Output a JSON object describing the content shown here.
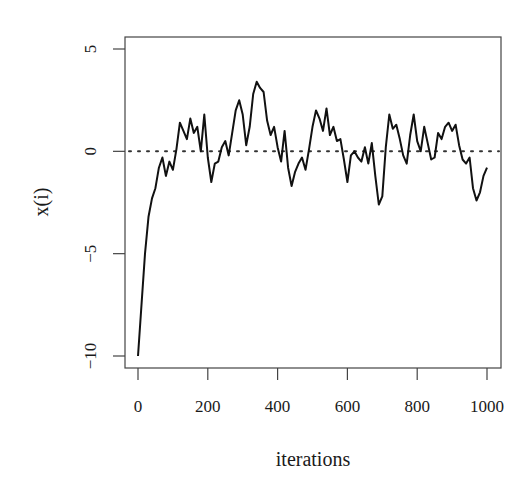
{
  "chart_data": {
    "type": "line",
    "title": "",
    "xlabel": "iterations",
    "ylabel": "x(i)",
    "xlim": [
      0,
      1000
    ],
    "ylim": [
      -10,
      5
    ],
    "x_ticks": [
      0,
      200,
      400,
      600,
      800,
      1000
    ],
    "x_tick_labels": [
      "0",
      "200",
      "400",
      "600",
      "800",
      "1000"
    ],
    "y_ticks": [
      -10,
      -5,
      0,
      5
    ],
    "y_tick_labels": [
      "−10",
      "−5",
      "0",
      "5"
    ],
    "grid": false,
    "legend": null,
    "reference_line": {
      "y": 0,
      "style": "dotted"
    },
    "series": [
      {
        "name": "x(i)",
        "x": [
          0,
          10,
          20,
          30,
          40,
          50,
          60,
          70,
          80,
          90,
          100,
          110,
          120,
          130,
          140,
          150,
          160,
          170,
          180,
          190,
          200,
          210,
          220,
          230,
          240,
          250,
          260,
          270,
          280,
          290,
          300,
          310,
          320,
          330,
          340,
          350,
          360,
          370,
          380,
          390,
          400,
          410,
          420,
          430,
          440,
          450,
          460,
          470,
          480,
          490,
          500,
          510,
          520,
          530,
          540,
          550,
          560,
          570,
          580,
          590,
          600,
          610,
          620,
          630,
          640,
          650,
          660,
          670,
          680,
          690,
          700,
          710,
          720,
          730,
          740,
          750,
          760,
          770,
          780,
          790,
          800,
          810,
          820,
          830,
          840,
          850,
          860,
          870,
          880,
          890,
          900,
          910,
          920,
          930,
          940,
          950,
          960,
          970,
          980,
          990,
          1000
        ],
        "values": [
          -10,
          -7.5,
          -5,
          -3.2,
          -2.3,
          -1.8,
          -0.8,
          -0.3,
          -1.2,
          -0.5,
          -0.9,
          0.1,
          1.4,
          1.0,
          0.6,
          1.6,
          0.9,
          1.2,
          0.0,
          1.8,
          -0.3,
          -1.5,
          -0.6,
          -0.5,
          0.2,
          0.5,
          -0.2,
          0.9,
          2.0,
          2.5,
          1.8,
          0.3,
          1.2,
          2.8,
          3.4,
          3.1,
          2.9,
          1.5,
          0.8,
          1.2,
          0.2,
          -0.5,
          1.0,
          -0.8,
          -1.7,
          -1.0,
          -0.6,
          -0.3,
          -0.9,
          0.1,
          1.2,
          2.0,
          1.6,
          1.0,
          2.1,
          0.8,
          1.2,
          0.5,
          0.6,
          -0.4,
          -1.5,
          -0.2,
          0.0,
          -0.3,
          -0.5,
          0.2,
          -0.6,
          0.4,
          -1.2,
          -2.6,
          -2.2,
          0.2,
          1.8,
          1.1,
          1.3,
          0.6,
          -0.2,
          -0.6,
          0.8,
          1.8,
          0.5,
          0.0,
          1.2,
          0.4,
          -0.4,
          -0.3,
          0.9,
          0.6,
          1.2,
          1.4,
          1.0,
          1.3,
          0.3,
          -0.4,
          -0.6,
          -0.3,
          -1.8,
          -2.4,
          -2.0,
          -1.2,
          -0.8
        ]
      }
    ]
  },
  "colors": {
    "line": "#111111",
    "axis": "#444444",
    "background": "#ffffff"
  },
  "layout": {
    "plot_left": 125,
    "plot_right": 501,
    "plot_top": 37,
    "plot_bottom": 368,
    "x0_px": 138,
    "x1000_px": 487,
    "y5_px": 49,
    "yneg10_px": 356
  }
}
